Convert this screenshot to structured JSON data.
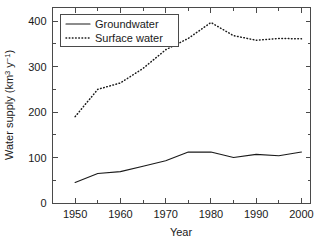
{
  "chart_data": {
    "type": "line",
    "title": "",
    "xlabel": "Year",
    "ylabel": "Water supply (km3 y-1)",
    "ylabel_parts": {
      "main": "Water supply (km",
      "sup1": "3",
      "mid": " y",
      "sup2": "−1",
      "tail": ")"
    },
    "xlim": [
      1945,
      2002
    ],
    "ylim": [
      0,
      430
    ],
    "grid": false,
    "legend_position": "upper left",
    "xticks": [
      1950,
      1960,
      1970,
      1980,
      1990,
      2000
    ],
    "xtick_labels": [
      "1950",
      "1960",
      "1970",
      "1980",
      "1990",
      "2000"
    ],
    "xminor_ticks": [
      1955,
      1965,
      1975,
      1985,
      1995
    ],
    "yticks": [
      0,
      100,
      200,
      300,
      400
    ],
    "ytick_labels": [
      "0",
      "100",
      "200",
      "300",
      "400"
    ],
    "yminor_ticks": [
      50,
      150,
      250,
      350
    ],
    "x": [
      1950,
      1955,
      1960,
      1965,
      1970,
      1975,
      1980,
      1985,
      1990,
      1995,
      2000
    ],
    "series": [
      {
        "name": "Groundwater",
        "style": "solid",
        "values": [
          45,
          65,
          69,
          81,
          93,
          112,
          112,
          100,
          107,
          104,
          112
        ]
      },
      {
        "name": "Surface water",
        "style": "dotted",
        "values": [
          190,
          250,
          264,
          296,
          337,
          362,
          397,
          368,
          358,
          362,
          361
        ]
      }
    ]
  },
  "legend": {
    "entries": [
      {
        "label": "Groundwater"
      },
      {
        "label": "Surface water"
      }
    ]
  },
  "colors": {
    "ink": "#1a1a1a",
    "axis": "#4a4a4a",
    "background": "#ffffff"
  }
}
